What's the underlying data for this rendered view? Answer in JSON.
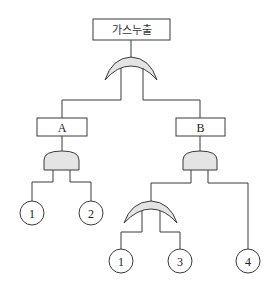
{
  "diagram": {
    "type": "fault-tree",
    "top_event": {
      "label": "가스누출"
    },
    "top_gate": {
      "type": "OR"
    },
    "intermediate_events": [
      {
        "id": "A",
        "label": "A",
        "gate": "AND"
      },
      {
        "id": "B",
        "label": "B",
        "gate": "AND"
      }
    ],
    "sub_gates": [
      {
        "parent": "B",
        "type": "OR",
        "inputs": [
          "1",
          "3"
        ]
      }
    ],
    "basic_events": [
      {
        "parent": "A",
        "label": "1"
      },
      {
        "parent": "A",
        "label": "2"
      },
      {
        "parent": "B-OR",
        "label": "1"
      },
      {
        "parent": "B-OR",
        "label": "3"
      },
      {
        "parent": "B",
        "label": "4"
      }
    ],
    "colors": {
      "gate_fill": "#e4e4e4",
      "stroke": "#3a3a3a",
      "background": "#ffffff"
    }
  }
}
